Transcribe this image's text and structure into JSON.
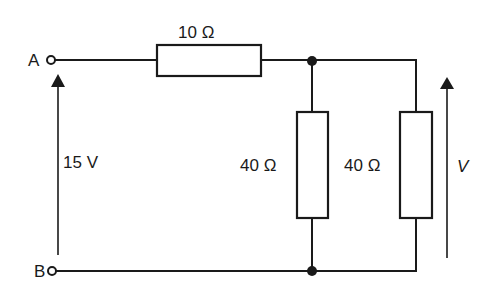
{
  "diagram": {
    "type": "circuit",
    "terminals": [
      {
        "id": "A",
        "label": "A"
      },
      {
        "id": "B",
        "label": "B"
      }
    ],
    "source": {
      "label": "15 V",
      "value_volts": 15,
      "direction": "B-to-A (arrow up)"
    },
    "resistors": [
      {
        "id": "R1",
        "label": "10 Ω",
        "ohms": 10,
        "position": "series, top wire"
      },
      {
        "id": "R2",
        "label": "40 Ω",
        "ohms": 40,
        "position": "shunt, middle branch"
      },
      {
        "id": "R3",
        "label": "40 Ω",
        "ohms": 40,
        "position": "shunt, right branch"
      }
    ],
    "output": {
      "label": "V",
      "description": "voltage across right 40 Ω (arrow up)"
    },
    "junctions": [
      "top node after 10 Ω",
      "bottom node below middle 40 Ω"
    ],
    "colors": {
      "ink": "#1a1a1a",
      "background": "#ffffff"
    }
  }
}
